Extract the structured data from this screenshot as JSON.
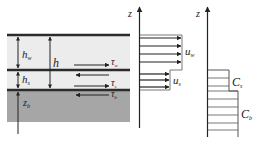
{
  "diagram": {
    "colors": {
      "water": "#ececec",
      "bed": "#a6a6a6",
      "line": "#2b2b2b",
      "stroke": "#333333"
    },
    "layers": {
      "labels": {
        "h_w": {
          "main": "h",
          "sub": "w"
        },
        "h_s": {
          "main": "h",
          "sub": "s"
        },
        "h": {
          "main": "h"
        },
        "z_b": {
          "main": "z",
          "sub": "b"
        }
      },
      "stresses": {
        "tau_w": {
          "main": "τ",
          "sub": "w"
        },
        "tau_s": {
          "main": "τ",
          "sub": "s"
        },
        "tau_b": {
          "main": "τ",
          "sub": "b"
        }
      }
    },
    "velocity_profile": {
      "axis_label": "z",
      "u_w": {
        "main": "u",
        "sub": "w"
      },
      "u_s": {
        "main": "u",
        "sub": "s"
      }
    },
    "concentration_profile": {
      "axis_label": "z",
      "C_s": {
        "main": "C",
        "sub": "s"
      },
      "C_b": {
        "main": "C",
        "sub": "b"
      }
    }
  }
}
